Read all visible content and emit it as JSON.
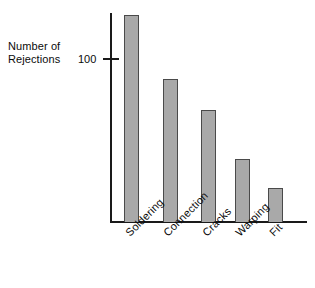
{
  "chart_data": {
    "type": "bar",
    "title": "",
    "subtitle": "",
    "xlabel": "",
    "ylabel": "Number of Rejections",
    "ylabel_lines": [
      "Number of",
      "Rejections"
    ],
    "categories": [
      "Soldering",
      "Connection",
      "Cracks",
      "Warping",
      "Fit"
    ],
    "values": [
      168,
      116,
      91,
      51,
      28
    ],
    "ytick_labels": [
      "100"
    ],
    "ytick_values": [
      100
    ],
    "ylim": [
      0,
      175
    ],
    "grid": false,
    "legend": false,
    "legend_position": "none",
    "bar_fill_color": "#a9a9a9",
    "bar_border_color": "#4a4a4a",
    "axis_color": "#1a1a1a",
    "background_color": "#ffffff",
    "label_rotation_degrees": -45,
    "annotations": []
  },
  "bars": [
    {
      "label": "Soldering",
      "value": 168,
      "left": 124,
      "width": 15,
      "top": 15,
      "height": 207
    },
    {
      "label": "Connection",
      "value": 116,
      "left": 163,
      "width": 15,
      "top": 79,
      "height": 143
    },
    {
      "label": "Cracks",
      "value": 91,
      "left": 201,
      "width": 15,
      "top": 110,
      "height": 112
    },
    {
      "label": "Warping",
      "value": 51,
      "left": 235,
      "width": 15,
      "top": 159,
      "height": 63
    },
    {
      "label": "Fit",
      "value": 28,
      "left": 268,
      "width": 15,
      "top": 188,
      "height": 34
    }
  ],
  "axis": {
    "y_label_line1": "Number of",
    "y_label_line2": "Rejections",
    "y_tick_label": "100"
  },
  "category_labels": [
    {
      "text": "Soldering",
      "left": 123,
      "top": 230
    },
    {
      "text": "Connection",
      "left": 161,
      "top": 230
    },
    {
      "text": "Cracks",
      "left": 200,
      "top": 230
    },
    {
      "text": "Warping",
      "left": 233,
      "top": 230
    },
    {
      "text": "Fit",
      "left": 267,
      "top": 230
    }
  ]
}
